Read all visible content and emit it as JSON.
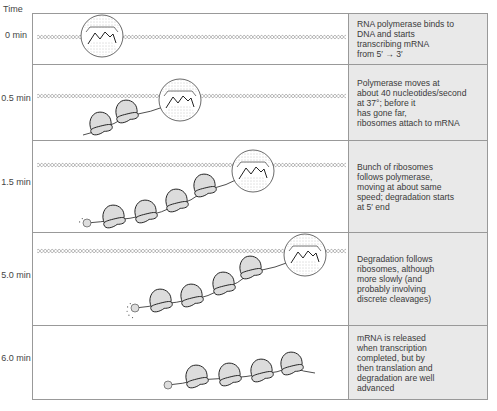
{
  "header": {
    "time_label": "Time"
  },
  "colors": {
    "border": "#999999",
    "description_bg": "#e9e9e9",
    "dna": "#aaaaaa",
    "ribosome_fill": "#dcdcdc",
    "stroke": "#222222"
  },
  "rows": [
    {
      "time": "0\nmin",
      "description": "RNA polymerase binds to\nDNA and starts\ntranscribing mRNA\nfrom 5′ → 3′",
      "top": 0,
      "height": 51,
      "dna_y": 23,
      "polymerase": {
        "x": 69,
        "y": 22
      },
      "mrna_start": null,
      "ribosomes": [],
      "degradation": null
    },
    {
      "time": "0.5\nmin",
      "description": "Polymerase moves at\nabout 40 nucleotides/second\nat 37°; before it\nhas gone far,\nribosomes attach to mRNA",
      "top": 51,
      "height": 76,
      "dna_y": 31,
      "polymerase": {
        "x": 147,
        "y": 35
      },
      "mrna_start": {
        "x": 50,
        "y": 70
      },
      "ribosomes": [
        {
          "x": 68,
          "y": 62
        },
        {
          "x": 94,
          "y": 50
        }
      ],
      "degradation": null
    },
    {
      "time": "1.5\nmin",
      "description": "Bunch of ribosomes\nfollows polymerase,\nmoving at about same\nspeed; degradation starts\nat 5′ end",
      "top": 127,
      "height": 92,
      "dna_y": 24,
      "polymerase": {
        "x": 220,
        "y": 30
      },
      "mrna_start": {
        "x": 54,
        "y": 82
      },
      "ribosomes": [
        {
          "x": 81,
          "y": 79
        },
        {
          "x": 113,
          "y": 74
        },
        {
          "x": 144,
          "y": 63
        },
        {
          "x": 172,
          "y": 48
        }
      ],
      "degradation": {
        "x": 54,
        "y": 82,
        "dots": 2
      }
    },
    {
      "time": "5.0\nmin",
      "description": "Degradation follows\nribosomes, although\nmore slowly (and\nprobably involving\ndiscrete cleavages)",
      "top": 219,
      "height": 93,
      "dna_y": 18,
      "polymerase": {
        "x": 272,
        "y": 22
      },
      "mrna_start": {
        "x": 102,
        "y": 75
      },
      "ribosomes": [
        {
          "x": 128,
          "y": 71
        },
        {
          "x": 159,
          "y": 66
        },
        {
          "x": 191,
          "y": 54
        },
        {
          "x": 218,
          "y": 38
        }
      ],
      "degradation": {
        "x": 102,
        "y": 75,
        "dots": 5
      }
    },
    {
      "time": "6.0\nmin",
      "description": "mRNA is released\nwhen transcription\ncompleted, but by\nthen translation and\ndegradation are well\nadvanced",
      "top": 312,
      "height": 73,
      "dna_y": null,
      "polymerase": null,
      "mrna_start": {
        "x": 135,
        "y": 59
      },
      "mrna_end": {
        "x": 282,
        "y": 47
      },
      "ribosomes": [
        {
          "x": 164,
          "y": 54
        },
        {
          "x": 197,
          "y": 52
        },
        {
          "x": 229,
          "y": 48
        },
        {
          "x": 259,
          "y": 41
        }
      ],
      "degradation": null
    }
  ]
}
